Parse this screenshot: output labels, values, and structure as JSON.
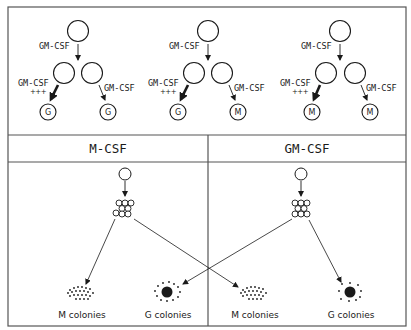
{
  "top_row": {
    "panels": [
      {
        "top_label": "GM-CSF",
        "left_label": "GM-CSF",
        "left_strength": "+++",
        "right_label": "GM-CSF",
        "left_outcome": "G",
        "right_outcome": "G"
      },
      {
        "top_label": "GM-CSF",
        "left_label": "GM-CSF",
        "left_strength": "+++",
        "right_label": "GM-CSF",
        "left_outcome": "G",
        "right_outcome": "M"
      },
      {
        "top_label": "GM-CSF",
        "left_label": "GM-CSF",
        "left_strength": "+++",
        "right_label": "GM-CSF",
        "left_outcome": "M",
        "right_outcome": "M"
      }
    ]
  },
  "bottom_row": {
    "headers": [
      "M-CSF",
      "GM-CSF"
    ],
    "colony_labels": [
      "M colonies",
      "G colonies",
      "M colonies",
      "G colonies"
    ]
  },
  "colors": {
    "line": "#1a1a1a",
    "background": "#ffffff",
    "border": "#555555"
  }
}
